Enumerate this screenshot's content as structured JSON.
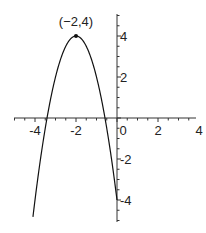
{
  "chart_data": {
    "type": "line",
    "title": "",
    "xlabel": "",
    "ylabel": "",
    "function": "y = -2(x+2)^2 + 4",
    "xlim": [
      -5,
      4
    ],
    "ylim": [
      -5,
      5
    ],
    "x_ticks": [
      -4,
      -2,
      0,
      2,
      4
    ],
    "y_ticks": [
      -4,
      -2,
      2,
      4
    ],
    "x_tick_labels": [
      "-4",
      "-2",
      "0",
      "2",
      "4"
    ],
    "y_tick_labels": [
      "-4",
      "-2",
      "2",
      "4"
    ],
    "curve_x_range": [
      -4.1,
      0.0
    ],
    "grid": false,
    "legend": null,
    "annotations": [
      {
        "text": "(−2,4)",
        "x": -2,
        "y": 4,
        "marker": "point"
      }
    ],
    "series": [
      {
        "name": "parabola",
        "x": [
          -4.1,
          -4,
          -3.5,
          -3.41,
          -3,
          -2.5,
          -2,
          -1.5,
          -1,
          -0.59,
          -0.5,
          0
        ],
        "values": [
          -4.82,
          -4,
          -0.5,
          0,
          2,
          3.5,
          4,
          3.5,
          2,
          0,
          -0.5,
          -4
        ]
      }
    ]
  },
  "colors": {
    "axis": "#333333",
    "curve": "#111111",
    "background": "#ffffff"
  }
}
